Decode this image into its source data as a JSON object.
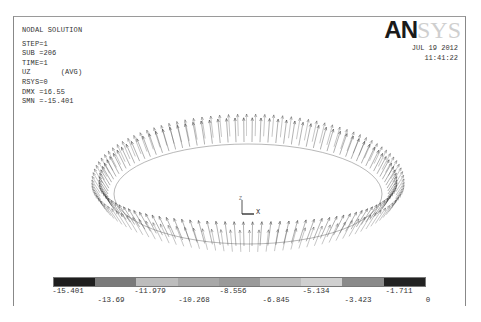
{
  "header": {
    "title": "NODAL SOLUTION",
    "info_rows": [
      "STEP=1",
      "SUB =206",
      "TIME=1",
      "UZ       (AVG)",
      "RSYS=0",
      "DMX =16.55",
      "SMN =-15.401"
    ]
  },
  "logo": {
    "bold_part": "AN",
    "light_part": "SYS"
  },
  "datetime": {
    "date": "JUL 19 2012",
    "time": "11:41:22"
  },
  "triad": {
    "x_label": "X",
    "z_label": "Z"
  },
  "plot": {
    "type": "vector arrow plot on elliptical ring",
    "arrow_color": "#333333",
    "ring_center": [
      248,
      190
    ],
    "arrow_count": 110
  },
  "legend": {
    "colors": [
      "#1e1e1e",
      "#6e6e6e",
      "#9a9a9a",
      "#bdbdbd",
      "#a9a9a9",
      "#8d8d8d",
      "#bababa",
      "#cfcfcf",
      "#7a7a7a",
      "#1c1c1c"
    ],
    "segment_colors": [
      "#1e1e1e",
      "#7a7a7a",
      "#bdbdbd",
      "#a8a8a8",
      "#9a9a9a",
      "#bcbcbc",
      "#d0d0d0",
      "#8a8a8a",
      "#222222"
    ],
    "upper_labels": [
      "-15.401",
      "-11.979",
      "-8.556",
      "-5.134",
      "-1.711"
    ],
    "lower_labels": [
      "-13.69",
      "-10.268",
      "-6.845",
      "-3.423",
      "0"
    ]
  }
}
